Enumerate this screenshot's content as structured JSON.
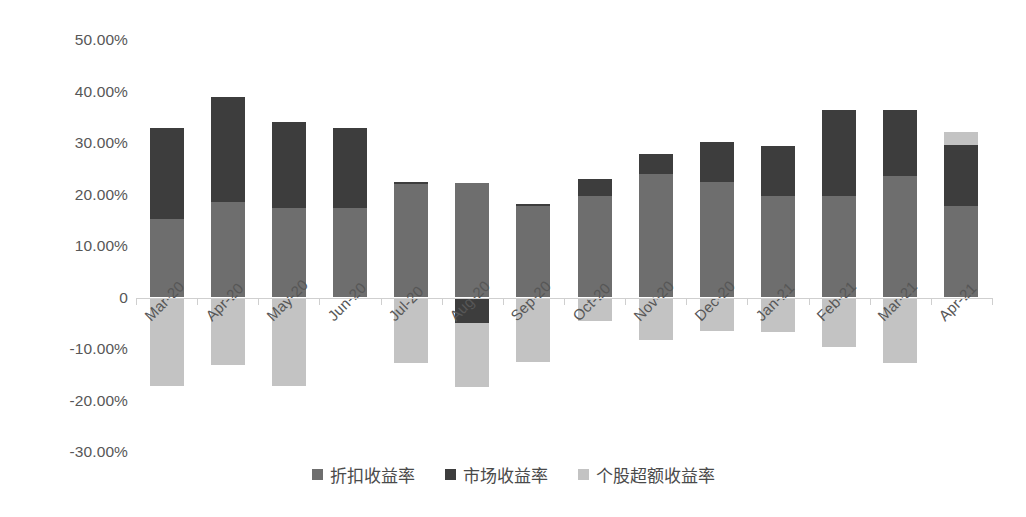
{
  "chart_data": {
    "type": "bar",
    "subtype": "stacked-bar",
    "title": "",
    "xlabel": "",
    "ylabel": "",
    "ylim": [
      -30,
      50
    ],
    "ytick_step": 10,
    "grid": false,
    "legend_position": "bottom",
    "y_tick_labels": [
      "50.00%",
      "40.00%",
      "30.00%",
      "20.00%",
      "10.00%",
      "0",
      "-10.00%",
      "-20.00%",
      "-30.00%"
    ],
    "y_tick_values": [
      50,
      40,
      30,
      20,
      10,
      0,
      -10,
      -20,
      -30
    ],
    "categories": [
      "Mar-20",
      "Apr-20",
      "May-20",
      "Jun-20",
      "Jul-20",
      "Aug-20",
      "Sep-20",
      "Oct-20",
      "Nov-20",
      "Dec-20",
      "Jan-21",
      "Feb-21",
      "Mar-21",
      "Apr-21"
    ],
    "series": [
      {
        "name": "折扣收益率",
        "color": "#6e6e6e",
        "values": [
          15.3,
          18.6,
          17.3,
          17.3,
          22.0,
          22.2,
          17.8,
          19.8,
          23.9,
          22.4,
          19.8,
          19.8,
          23.5,
          17.8
        ]
      },
      {
        "name": "市场收益率",
        "color": "#3d3d3d",
        "values": [
          17.7,
          20.4,
          16.7,
          15.7,
          0.5,
          -5.0,
          0.4,
          3.2,
          3.9,
          7.8,
          9.6,
          16.7,
          13.0,
          11.8
        ]
      },
      {
        "name": "个股超额收益率",
        "color": "#c3c3c3",
        "values": [
          -17.1,
          -13.1,
          -17.1,
          0.0,
          -12.7,
          -12.4,
          -12.6,
          -4.5,
          -8.2,
          -6.5,
          -6.7,
          -9.6,
          -12.7,
          2.6
        ]
      }
    ]
  },
  "legend": {
    "items": [
      {
        "label": "折扣收益率",
        "color": "#6e6e6e",
        "swatch_name": "legend-swatch-discount-return"
      },
      {
        "label": "市场收益率",
        "color": "#3d3d3d",
        "swatch_name": "legend-swatch-market-return"
      },
      {
        "label": "个股超额收益率",
        "color": "#c3c3c3",
        "swatch_name": "legend-swatch-stock-excess-return"
      }
    ]
  },
  "axis": {
    "zero_line_color": "#cfcfcf",
    "tick_color": "#cfcfcf",
    "label_color": "#575757"
  }
}
